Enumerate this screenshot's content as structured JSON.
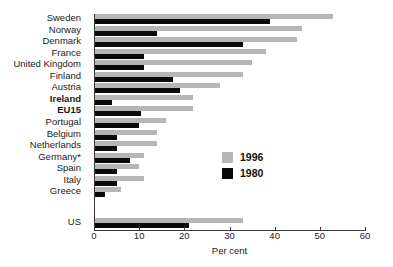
{
  "chart_data": {
    "type": "bar",
    "orientation": "horizontal",
    "title": "",
    "xlabel": "Per cent",
    "ylabel": "",
    "xlim": [
      0,
      60
    ],
    "xticks": [
      0,
      10,
      20,
      30,
      40,
      50,
      60
    ],
    "grid": false,
    "legend_position": "middle-right",
    "categories": [
      "Sweden",
      "Norway",
      "Denmark",
      "France",
      "United Kingdom",
      "Finland",
      "Austria",
      "Ireland",
      "EU15",
      "Portugal",
      "Belgium",
      "Netherlands",
      "Germany*",
      "Spain",
      "Italy",
      "Greece",
      "US"
    ],
    "emphasized_categories": [
      "Ireland",
      "EU15"
    ],
    "separated_categories": [
      "US"
    ],
    "series": [
      {
        "name": "1996",
        "color": "#b6b6b6",
        "values": [
          53,
          46,
          45,
          38,
          35,
          33,
          28,
          22,
          22,
          16,
          14,
          14,
          11,
          10,
          11,
          6,
          33
        ]
      },
      {
        "name": "1980",
        "color": "#0a0a0a",
        "values": [
          39,
          14,
          33,
          11,
          11,
          17.5,
          19,
          4,
          10.5,
          10,
          5,
          5,
          8,
          5,
          5,
          2.5,
          21
        ]
      }
    ]
  },
  "legend": {
    "entries": [
      {
        "label": "1996",
        "color": "#b6b6b6"
      },
      {
        "label": "1980",
        "color": "#0a0a0a"
      }
    ]
  }
}
